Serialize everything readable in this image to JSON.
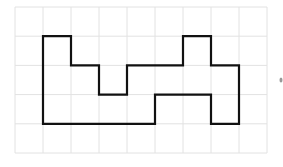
{
  "diagram": {
    "type": "grid-polyomino",
    "grid": {
      "cols": 9,
      "rows": 5,
      "origin_x": 15,
      "origin_y": 7,
      "cell_w": 28.0,
      "cell_h": 29.2,
      "line_color": "#e2e2e2"
    },
    "shape": {
      "stroke_color": "#111111",
      "stroke_width": 2.2,
      "vertices_grid": [
        [
          3,
          1
        ],
        [
          3,
          1
        ],
        [
          1,
          1
        ],
        [
          1,
          4
        ],
        [
          5,
          4
        ],
        [
          5,
          3
        ],
        [
          7,
          3
        ],
        [
          7,
          4
        ],
        [
          8,
          4
        ],
        [
          8,
          2
        ],
        [
          7,
          2
        ],
        [
          7,
          1
        ],
        [
          6,
          1
        ],
        [
          6,
          2
        ],
        [
          3,
          2
        ],
        [
          3,
          3
        ],
        [
          2,
          3
        ],
        [
          2,
          2
        ],
        [
          1,
          2
        ]
      ],
      "outline": [
        [
          1,
          1
        ],
        [
          2,
          1
        ],
        [
          2,
          2
        ],
        [
          3,
          2
        ],
        [
          3,
          3
        ],
        [
          4,
          3
        ],
        [
          4,
          2
        ],
        [
          6,
          2
        ],
        [
          6,
          1
        ],
        [
          7,
          1
        ],
        [
          7,
          2
        ],
        [
          8,
          2
        ],
        [
          8,
          4
        ],
        [
          7,
          4
        ],
        [
          7,
          3
        ],
        [
          5,
          3
        ],
        [
          5,
          4
        ],
        [
          1,
          4
        ]
      ]
    },
    "marker": {
      "x": 281,
      "y": 80,
      "color": "#999999"
    }
  }
}
